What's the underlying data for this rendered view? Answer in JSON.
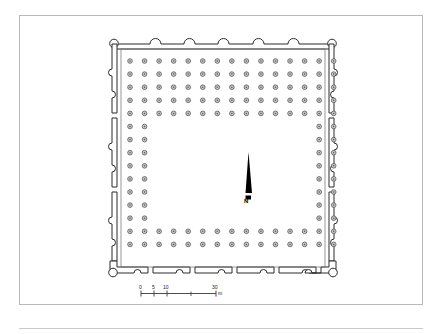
{
  "figure": {
    "type": "architectural-floor-plan",
    "orientation_marker": "N",
    "north_label": "N"
  },
  "scale_bar": {
    "unit_label": "m",
    "ticks": [
      {
        "label": "0",
        "value": 0
      },
      {
        "label": "5",
        "value": 5
      },
      {
        "label": "10",
        "value": 10
      },
      {
        "label": "30",
        "value": 30
      }
    ]
  },
  "colors": {
    "wall_stroke": "#2b2b2b",
    "wall_fill": "#ffffff",
    "column_stroke": "#4a4a4a",
    "column_fill": "#c9c9c9",
    "frame": "#b9b9b9",
    "north_arrow": "#000000",
    "paper": "#ffffff"
  },
  "plan_structure": {
    "perimeter": "rectangular enceinte",
    "corner_towers": 4,
    "top_bastions": 5,
    "side_wall_segments": 3,
    "bottom_wall_segments": 6,
    "courtyard": "central open rectangular court",
    "column_grid": "dense grid of circular column bases surrounding courtyard"
  }
}
